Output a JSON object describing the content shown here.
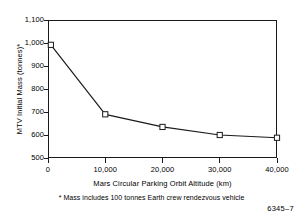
{
  "chart_data": {
    "type": "line",
    "title": "",
    "xlabel": "Mars Circular Parking Orbit Altitude (km)",
    "ylabel": "MTV Initial Mass (tonnes)*",
    "xlim": [
      0,
      40000
    ],
    "ylim": [
      500,
      1100
    ],
    "grid": false,
    "legend": null,
    "marker": "open-square",
    "x": [
      500,
      10000,
      20000,
      30000,
      40000
    ],
    "values": [
      992,
      690,
      635,
      600,
      588
    ],
    "series": [
      {
        "name": "MTV Initial Mass",
        "x": [
          500,
          10000,
          20000,
          30000,
          40000
        ],
        "values": [
          992,
          690,
          635,
          600,
          588
        ]
      }
    ],
    "xticks": [
      0,
      10000,
      20000,
      30000,
      40000
    ],
    "xticklabels": [
      "0",
      "10,000",
      "20,000",
      "30,000",
      "40,000"
    ],
    "yticks": [
      500,
      600,
      700,
      800,
      900,
      1000,
      1100
    ],
    "yticklabels": [
      "500",
      "600",
      "700",
      "800",
      "900",
      "1,000",
      "1,100"
    ],
    "annotations": [
      "* Mass includes 100 tonnes Earth crew rendezvous vehicle"
    ]
  },
  "figure": {
    "footnote": "* Mass includes 100 tonnes Earth crew rendezvous vehicle",
    "id_label": "6345–7"
  },
  "colors": {
    "line": "#1a1a1a",
    "axis": "#1a1a1a",
    "marker_fill": "#ffffff",
    "background": "#ffffff"
  }
}
